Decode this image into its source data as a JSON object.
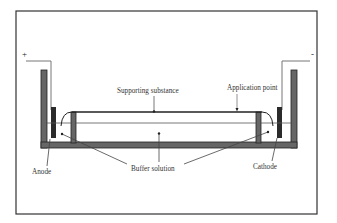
{
  "diagram": {
    "labels": {
      "plus": "+",
      "minus": "-",
      "application_point": "Application point",
      "supporting_substance": "Supporting substance",
      "buffer_solution": "Buffer solution",
      "anode": "Anode",
      "cathode": "Cathode"
    },
    "colors": {
      "frame": "#333333",
      "wall_fill": "#666666",
      "electrode_fill": "#2b2b2b",
      "line": "#444444",
      "text": "#333333",
      "background": "#ffffff"
    }
  }
}
